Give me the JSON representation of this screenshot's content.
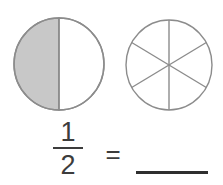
{
  "worksheet": {
    "title": "Equivalent fraction worksheet",
    "background_color": "#ffffff"
  },
  "figures": [
    {
      "name": "half-shaded-circle",
      "shape": "circle",
      "total_parts": 2,
      "shaded_parts": 1,
      "shaded_side": "left",
      "fraction_shown": "1/2",
      "stroke_color": "#8c8c8c",
      "fill_color": "#c8c8c8",
      "unfilled_color": "#ffffff"
    },
    {
      "name": "sixths-circle",
      "shape": "circle",
      "total_parts": 6,
      "shaded_parts": 0,
      "fraction_shown": "",
      "stroke_color": "#8c8c8c",
      "fill_color": "#ffffff",
      "unfilled_color": "#ffffff"
    }
  ],
  "equation": {
    "numerator": "1",
    "denominator": "2",
    "operator": "=",
    "answer_value": "",
    "answer_blank_label": "blank-answer-line",
    "text_color": "#3c3c3c",
    "blank_line_color": "#2f2f2f"
  }
}
